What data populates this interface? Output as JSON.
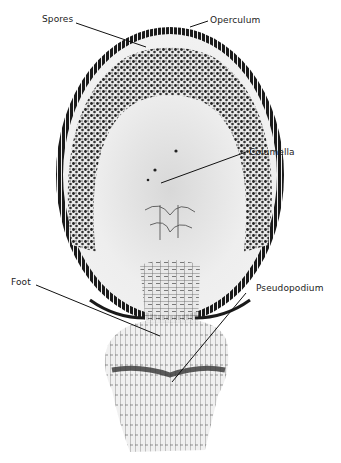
{
  "figure": {
    "labels": {
      "spores": "Spores",
      "operculum": "Operculum",
      "columella": "Columella",
      "foot": "Foot",
      "pseudopodium": "Pseudopodium"
    }
  },
  "colors": {
    "background": "#ffffff",
    "wall": "#1a1a1a",
    "spores": "#2a2a2a",
    "interior": "#ececec",
    "label_text": "#222222"
  }
}
